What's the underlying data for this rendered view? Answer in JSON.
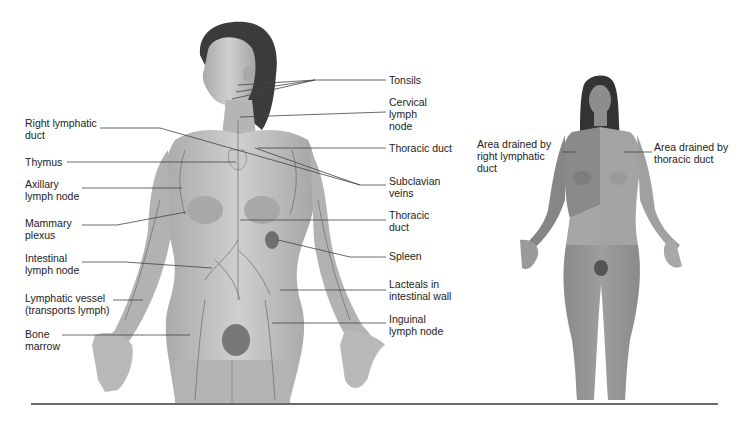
{
  "diagram": {
    "main_figure": {
      "left_labels": [
        {
          "id": "right-lymphatic-duct",
          "text": "Right lymphatic\nduct",
          "x": 25,
          "y": 117
        },
        {
          "id": "thymus",
          "text": "Thymus",
          "x": 25,
          "y": 155
        },
        {
          "id": "axillary-lymph-node",
          "text": "Axillary\nlymph node",
          "x": 25,
          "y": 178
        },
        {
          "id": "mammary-plexus",
          "text": "Mammary\nplexus",
          "x": 25,
          "y": 217
        },
        {
          "id": "intestinal-lymph-node",
          "text": "Intestinal\nlymph node",
          "x": 25,
          "y": 252
        },
        {
          "id": "lymphatic-vessel",
          "text": "Lymphatic vessel\n(transports lymph)",
          "x": 25,
          "y": 292
        },
        {
          "id": "bone-marrow",
          "text": "Bone\nmarrow",
          "x": 25,
          "y": 328
        }
      ],
      "right_labels": [
        {
          "id": "tonsils",
          "text": "Tonsils",
          "x": 389,
          "y": 73
        },
        {
          "id": "cervical-lymph-node",
          "text": "Cervical\nlymph\nnode",
          "x": 389,
          "y": 96
        },
        {
          "id": "thoracic-duct-upper",
          "text": "Thoracic duct",
          "x": 389,
          "y": 141
        },
        {
          "id": "subclavian-veins",
          "text": "Subclavian\nveins",
          "x": 389,
          "y": 175
        },
        {
          "id": "thoracic-duct-lower",
          "text": "Thoracic\nduct",
          "x": 389,
          "y": 209
        },
        {
          "id": "spleen",
          "text": "Spleen",
          "x": 389,
          "y": 249
        },
        {
          "id": "lacteals",
          "text": "Lacteals in\nintestinal wall",
          "x": 389,
          "y": 277
        },
        {
          "id": "inguinal-lymph-node",
          "text": "Inguinal\nlymph node",
          "x": 389,
          "y": 313
        }
      ]
    },
    "drainage_figure": {
      "labels": [
        {
          "id": "right-lymphatic-area",
          "text": "Area drained by\nright lymphatic\nduct",
          "x": 477,
          "y": 138
        },
        {
          "id": "thoracic-duct-area",
          "text": "Area drained by\nthoracic duct",
          "x": 654,
          "y": 141
        }
      ]
    },
    "colors": {
      "skin": "#b8b8b8",
      "skin_dark": "#8e8e8e",
      "hair": "#3a3a3a",
      "leader_line": "#444444",
      "rule": "#6a6a6a"
    }
  }
}
